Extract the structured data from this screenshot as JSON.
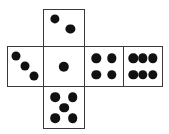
{
  "figure": {
    "canvas": {
      "width": 169,
      "height": 134
    },
    "colors": {
      "background": "#ffffff",
      "face_fill": "#ffffff",
      "face_stroke": "#3a3a3a",
      "pip_fill": "#111111"
    },
    "faces": [
      {
        "id": "top",
        "name": "face-top",
        "position": "top",
        "value": 2,
        "value_label": "2",
        "rect": {
          "x": 43,
          "y": 9,
          "w": 42,
          "h": 38
        },
        "pips": [
          {
            "cx": 27,
            "cy": 24,
            "r": 4.6
          },
          {
            "cx": 66,
            "cy": 52,
            "r": 4.6
          }
        ]
      },
      {
        "id": "left",
        "name": "face-left",
        "position": "middle-row-1",
        "value": 3,
        "value_label": "3",
        "rect": {
          "x": 7,
          "y": 46,
          "w": 37,
          "h": 41
        },
        "pips": [
          {
            "cx": 24,
            "cy": 24,
            "r": 4.5
          },
          {
            "cx": 48,
            "cy": 49,
            "r": 4.5
          },
          {
            "cx": 73,
            "cy": 74,
            "r": 4.5
          }
        ]
      },
      {
        "id": "center",
        "name": "face-center",
        "position": "middle-row-2",
        "value": 1,
        "value_label": "1",
        "rect": {
          "x": 43,
          "y": 46,
          "w": 42,
          "h": 41
        },
        "pips": [
          {
            "cx": 50,
            "cy": 50,
            "r": 5.2
          }
        ]
      },
      {
        "id": "right-inner",
        "name": "face-right-inner",
        "position": "middle-row-3",
        "value": 4,
        "value_label": "4",
        "rect": {
          "x": 84,
          "y": 46,
          "w": 40,
          "h": 41
        },
        "pips": [
          {
            "cx": 30,
            "cy": 29,
            "r": 4.7
          },
          {
            "cx": 70,
            "cy": 29,
            "r": 4.7
          },
          {
            "cx": 30,
            "cy": 71,
            "r": 4.7
          },
          {
            "cx": 70,
            "cy": 71,
            "r": 4.7
          }
        ]
      },
      {
        "id": "right-outer",
        "name": "face-right-outer",
        "position": "middle-row-4",
        "value": 6,
        "value_label": "6",
        "rect": {
          "x": 123,
          "y": 46,
          "w": 40,
          "h": 41
        },
        "pips": [
          {
            "cx": 24,
            "cy": 29,
            "r": 4.7
          },
          {
            "cx": 50,
            "cy": 29,
            "r": 4.7
          },
          {
            "cx": 76,
            "cy": 29,
            "r": 4.7
          },
          {
            "cx": 24,
            "cy": 71,
            "r": 4.7
          },
          {
            "cx": 50,
            "cy": 71,
            "r": 4.7
          },
          {
            "cx": 76,
            "cy": 71,
            "r": 4.7
          }
        ]
      },
      {
        "id": "bottom",
        "name": "face-bottom",
        "position": "bottom",
        "value": 5,
        "value_label": "5",
        "rect": {
          "x": 43,
          "y": 86,
          "w": 42,
          "h": 43
        },
        "pips": [
          {
            "cx": 28,
            "cy": 25,
            "r": 4.8
          },
          {
            "cx": 72,
            "cy": 25,
            "r": 4.8
          },
          {
            "cx": 50,
            "cy": 50,
            "r": 4.8
          },
          {
            "cx": 28,
            "cy": 76,
            "r": 4.8
          },
          {
            "cx": 72,
            "cy": 76,
            "r": 4.8
          }
        ]
      }
    ]
  }
}
